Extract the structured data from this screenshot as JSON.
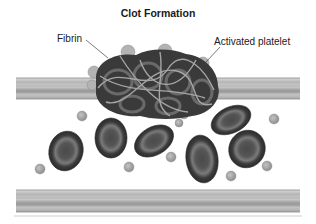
{
  "diagram": {
    "title": "Clot Formation",
    "labels": [
      {
        "id": "fibrin",
        "text": "Fibrin"
      },
      {
        "id": "activated-platelet",
        "text": "Activated platelet"
      }
    ],
    "elements": {
      "vessel_walls": [
        "upper-vessel-wall",
        "lower-vessel-wall"
      ],
      "clot": "clot-mass",
      "red_blood_cell_count": 6,
      "platelet_count": 8
    },
    "colors": {
      "wall_light": "#c8c8c8",
      "wall_dark": "#8f8f8f",
      "rbc_outer": "#3a3a3a",
      "rbc_ring": "#6e6e6e",
      "rbc_center": "#4a4a4a",
      "platelet": "#a9a9a9",
      "fibrin": "#9a9a9a"
    }
  }
}
